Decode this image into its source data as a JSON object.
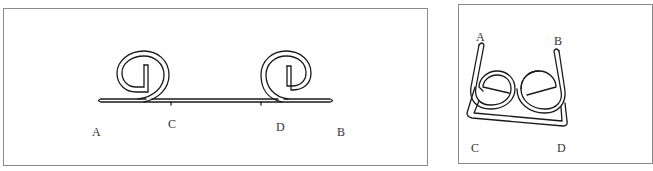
{
  "figures": [
    {
      "id": "flat-wire",
      "description": "Straight wire with two scroll loops",
      "labels": {
        "A": "A",
        "B": "B",
        "C": "C",
        "D": "D"
      }
    },
    {
      "id": "folded-wire",
      "description": "Wire bent into U-shape with two interlocking loops",
      "labels": {
        "A": "A",
        "B": "B",
        "C": "C",
        "D": "D"
      }
    }
  ],
  "colors": {
    "stroke": "#1a1a1a",
    "frame": "#8a8a8a",
    "label": "#333333"
  }
}
